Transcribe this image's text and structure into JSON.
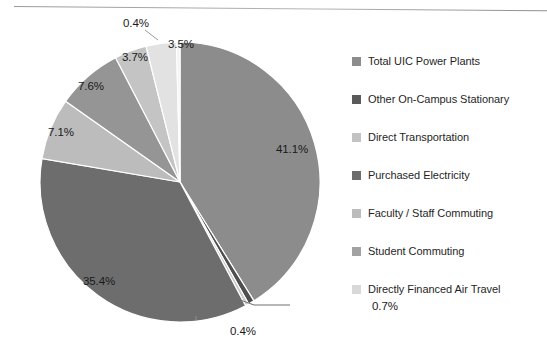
{
  "chart_data": {
    "type": "pie",
    "title": "",
    "xlabel": "",
    "ylabel": "",
    "legend_position": "right",
    "grid": false,
    "unit": "%",
    "categories": [
      "Total UIC Power Plants",
      "Other On-Campus Stationary",
      "Direct Transportation",
      "Purchased Electricity",
      "Faculty / Staff Commuting",
      "Student Commuting",
      "Directly Financed Air Travel"
    ],
    "values": [
      41.1,
      0.7,
      0.4,
      35.4,
      7.1,
      7.6,
      3.7
    ],
    "slices": [
      {
        "label": "Total UIC Power Plants",
        "value": 41.1,
        "display": "41.1%",
        "color": "#8c8c8c"
      },
      {
        "label": "Other On-Campus Stationary",
        "value": 0.7,
        "display": "0.7%",
        "color": "#4f4f4f"
      },
      {
        "label": "Direct Transportation",
        "value": 0.4,
        "display": "0.4%",
        "color": "#c9c9c9"
      },
      {
        "label": "Purchased Electricity",
        "value": 35.4,
        "display": "35.4%",
        "color": "#6d6d6d"
      },
      {
        "label": "Faculty / Staff Commuting",
        "value": 7.1,
        "display": "7.1%",
        "color": "#bcbcbc"
      },
      {
        "label": "Student Commuting",
        "value": 7.6,
        "display": "7.6%",
        "color": "#959595"
      },
      {
        "label": "Directly Financed Air Travel",
        "value": 3.7,
        "display": "3.7%",
        "color": "#c4c4c4"
      },
      {
        "label": "",
        "value": 3.5,
        "display": "3.5%",
        "color": "#e2e2e2"
      },
      {
        "label": "",
        "value": 0.4,
        "display": "0.4%",
        "color": "#f2f2f2"
      }
    ],
    "data_labels": [
      {
        "text": "41.1%",
        "x": 276,
        "y": 143
      },
      {
        "text": "35.4%",
        "x": 83,
        "y": 275
      },
      {
        "text": "7.1%",
        "x": 48,
        "y": 126
      },
      {
        "text": "7.6%",
        "x": 78,
        "y": 80
      },
      {
        "text": "3.7%",
        "x": 122,
        "y": 51
      },
      {
        "text": "3.5%",
        "x": 168,
        "y": 38
      },
      {
        "text": "0.4%",
        "x": 123,
        "y": 17
      },
      {
        "text": "0.7%",
        "x": 372,
        "y": 300
      },
      {
        "text": "0.4%",
        "x": 230,
        "y": 325
      }
    ]
  },
  "legend": {
    "items": [
      {
        "label": "Total UIC Power Plants",
        "color": "#8c8c8c"
      },
      {
        "label": "Other On-Campus Stationary",
        "color": "#5a5a5a"
      },
      {
        "label": "Direct Transportation",
        "color": "#c2c2c2"
      },
      {
        "label": "Purchased Electricity",
        "color": "#6d6d6d"
      },
      {
        "label": "Faculty / Staff Commuting",
        "color": "#bcbcbc"
      },
      {
        "label": "Student Commuting",
        "color": "#a2a2a2"
      },
      {
        "label": "Directly Financed Air Travel",
        "color": "#d8d8d8"
      }
    ]
  }
}
